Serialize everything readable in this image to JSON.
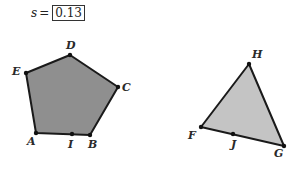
{
  "parameter": {
    "variable": "s",
    "equals": "=",
    "value": "0.13"
  },
  "figures": {
    "pentagon": {
      "fill": "#8f8f8f",
      "stroke": "#1a1a1a",
      "points": "36,133 90,135 118,87 70,55 26,73",
      "vertices": [
        {
          "label": "A",
          "x": 36,
          "y": 133,
          "lx": 27,
          "ly": 145
        },
        {
          "label": "B",
          "x": 90,
          "y": 135,
          "lx": 88,
          "ly": 148
        },
        {
          "label": "C",
          "x": 118,
          "y": 87,
          "lx": 122,
          "ly": 91
        },
        {
          "label": "D",
          "x": 70,
          "y": 55,
          "lx": 66,
          "ly": 49
        },
        {
          "label": "E",
          "x": 26,
          "y": 73,
          "lx": 12,
          "ly": 75
        }
      ],
      "midpoint": {
        "label": "I",
        "x": 72,
        "y": 134,
        "lx": 68,
        "ly": 148
      }
    },
    "triangle": {
      "fill": "#c4c4c4",
      "stroke": "#1a1a1a",
      "points": "201,127 284,146 249,64",
      "vertices": [
        {
          "label": "F",
          "x": 201,
          "y": 127,
          "lx": 188,
          "ly": 139
        },
        {
          "label": "G",
          "x": 284,
          "y": 146,
          "lx": 274,
          "ly": 157
        },
        {
          "label": "H",
          "x": 249,
          "y": 64,
          "lx": 252,
          "ly": 58
        }
      ],
      "midpoint": {
        "label": "J",
        "x": 233,
        "y": 134,
        "lx": 231,
        "ly": 148
      }
    }
  }
}
